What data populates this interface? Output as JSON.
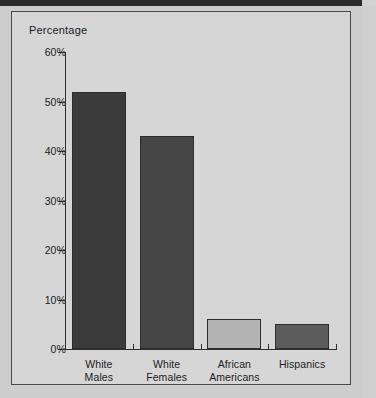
{
  "figure": {
    "y_axis_title": "Percentage",
    "background_color": "#d6d6d6",
    "frame_color": "#4a4a4a",
    "page_background": "#cdcdcd",
    "top_band_color": "#2b2b2b"
  },
  "chart_data": {
    "type": "bar",
    "title": "",
    "subtitle": "",
    "xlabel": "",
    "ylabel": "Percentage",
    "categories": [
      "White Males",
      "White Females",
      "African Americans",
      "Hispanics"
    ],
    "category_lines": [
      [
        "White",
        "Males"
      ],
      [
        "White",
        "Females"
      ],
      [
        "African",
        "Americans"
      ],
      [
        "Hispanics"
      ]
    ],
    "values": [
      52,
      43,
      6,
      5
    ],
    "value_labels": [
      "52%",
      "43%",
      "6%",
      "5%"
    ],
    "bar_colors": [
      "#3b3b3b",
      "#464646",
      "#b3b3b3",
      "#5c5c5c"
    ],
    "bar_border_color": "#2d2d2d",
    "ylim": [
      0,
      60
    ],
    "ytick_values": [
      0,
      10,
      20,
      30,
      40,
      50,
      60
    ],
    "ytick_labels": [
      "0%",
      "10%",
      "20%",
      "30%",
      "40%",
      "50%",
      "60%"
    ],
    "grid": false,
    "legend": false,
    "legend_position": "none"
  }
}
